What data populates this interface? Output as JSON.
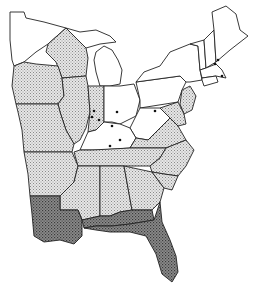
{
  "map": {
    "title": "",
    "region": "Eastern United States",
    "legend_classes": {
      "none": {
        "fill": "#ffffff"
      },
      "light": {
        "fill": "url(#lightStipple)"
      },
      "dark": {
        "fill": "url(#darkStipple)"
      }
    },
    "colors": {
      "outline": "#222222",
      "light_shade": "#cfcfcf",
      "dark_shade": "#7a7a7a",
      "dot": "#111111"
    },
    "states": [
      {
        "name": "Minnesota",
        "shade": "none",
        "points": "10,12 24,12 26,18 44,22 66,28 48,44 36,52 24,62 14,66 12,60 10,40"
      },
      {
        "name": "Wisconsin",
        "shade": "light",
        "points": "48,44 66,28 78,40 86,48 88,58 86,76 62,78 56,62 46,52"
      },
      {
        "name": "Michigan-UP",
        "shade": "none",
        "points": "66,28 80,32 96,30 110,36 116,42 100,44 86,48 78,40"
      },
      {
        "name": "Michigan-LP",
        "shade": "none",
        "points": "96,52 104,46 112,50 118,60 122,70 120,84 110,86 100,86 96,72 94,60"
      },
      {
        "name": "Iowa",
        "shade": "light",
        "points": "14,66 24,62 36,64 58,66 62,78 64,96 58,104 16,104 12,86"
      },
      {
        "name": "Illinois",
        "shade": "light",
        "points": "62,78 86,76 88,86 90,112 86,128 80,140 74,144 66,130 60,112 58,104 64,96"
      },
      {
        "name": "Missouri",
        "shade": "light",
        "points": "16,104 58,104 60,112 66,130 74,144 72,152 24,152 22,130 18,112"
      },
      {
        "name": "Indiana",
        "shade": "light",
        "points": "88,86 104,86 104,122 96,130 88,132 90,112"
      },
      {
        "name": "Ohio",
        "shade": "none",
        "points": "104,86 120,86 134,84 140,100 136,116 120,124 112,122 104,122"
      },
      {
        "name": "Pennsylvania",
        "shade": "none",
        "points": "136,82 180,76 186,82 182,90 178,102 140,108 140,100"
      },
      {
        "name": "New-York",
        "shade": "none",
        "points": "136,82 144,72 160,66 170,52 190,44 198,46 200,70 202,80 190,82 186,82 180,76"
      },
      {
        "name": "Vermont",
        "shade": "none",
        "points": "190,44 204,40 206,68 200,70 198,46"
      },
      {
        "name": "New-Hampshire",
        "shade": "none",
        "points": "204,40 214,30 216,62 206,68"
      },
      {
        "name": "Maine",
        "shade": "none",
        "points": "212,12 226,6 236,14 240,30 248,36 230,50 216,62 214,30"
      },
      {
        "name": "Massachusetts",
        "shade": "none",
        "points": "200,70 206,68 216,64 222,70 226,78 216,76 202,78"
      },
      {
        "name": "Connecticut-RI",
        "shade": "none",
        "points": "202,78 216,76 218,82 204,86 202,80"
      },
      {
        "name": "New-Jersey",
        "shade": "light",
        "points": "182,90 190,86 196,96 192,110 184,114 180,104"
      },
      {
        "name": "Delaware-Maryland",
        "shade": "light",
        "points": "160,108 178,102 184,114 186,124 178,126 170,118"
      },
      {
        "name": "West-Virginia",
        "shade": "none",
        "points": "136,116 140,108 160,108 170,118 160,128 148,140 136,138 130,128"
      },
      {
        "name": "Kentucky",
        "shade": "none",
        "points": "88,132 96,130 104,122 120,124 130,128 136,138 130,148 100,150 92,150 80,150"
      },
      {
        "name": "Virginia",
        "shade": "light",
        "points": "130,148 136,138 148,140 160,128 170,118 178,126 186,140 166,148"
      },
      {
        "name": "Tennessee",
        "shade": "light",
        "points": "74,152 80,150 92,150 130,148 166,148 160,158 150,166 78,166"
      },
      {
        "name": "North-Carolina",
        "shade": "light",
        "points": "150,166 160,158 166,148 186,140 194,150 186,166 178,176 164,174 152,172"
      },
      {
        "name": "Arkansas",
        "shade": "light",
        "points": "24,152 72,152 78,166 74,182 60,196 30,196 28,174"
      },
      {
        "name": "Mississippi",
        "shade": "light",
        "points": "78,166 100,166 100,216 82,220 78,210 60,210 60,196 74,182"
      },
      {
        "name": "Alabama",
        "shade": "light",
        "points": "100,166 124,166 132,210 120,212 110,216 100,216"
      },
      {
        "name": "Georgia",
        "shade": "light",
        "points": "124,166 152,172 164,188 160,202 152,210 132,210"
      },
      {
        "name": "South-Carolina",
        "shade": "light",
        "points": "152,172 164,174 178,176 172,190 164,188"
      },
      {
        "name": "Louisiana",
        "shade": "dark",
        "points": "30,196 60,196 60,210 78,210 82,220 82,236 74,244 60,240 44,242 34,236 32,214"
      },
      {
        "name": "Gulf-Coast-MS-AL",
        "shade": "dark",
        "points": "82,220 100,216 110,216 120,212 132,210 152,210 154,220 130,224 112,226 96,226 84,228"
      },
      {
        "name": "Florida",
        "shade": "dark",
        "points": "84,228 96,226 112,226 130,224 154,220 160,202 162,222 170,240 176,256 178,272 172,282 162,274 156,254 146,236 130,232 110,232 96,230"
      }
    ],
    "dots": [
      {
        "x": 94,
        "y": 111,
        "location": "Indiana-north"
      },
      {
        "x": 92,
        "y": 117,
        "location": "Indiana-west"
      },
      {
        "x": 99,
        "y": 120,
        "location": "Indiana-south"
      },
      {
        "x": 117,
        "y": 112,
        "location": "Ohio-central"
      },
      {
        "x": 112,
        "y": 126,
        "location": "Ohio-southwest"
      },
      {
        "x": 120,
        "y": 140,
        "location": "Kentucky-east"
      },
      {
        "x": 110,
        "y": 146,
        "location": "Kentucky-west"
      },
      {
        "x": 155,
        "y": 111,
        "location": "Pennsylvania-west"
      },
      {
        "x": 215,
        "y": 64,
        "location": "New-Hampshire"
      },
      {
        "x": 218,
        "y": 60,
        "location": "New-Hampshire-north"
      },
      {
        "x": 222,
        "y": 76,
        "location": "Massachusetts-east"
      }
    ]
  }
}
